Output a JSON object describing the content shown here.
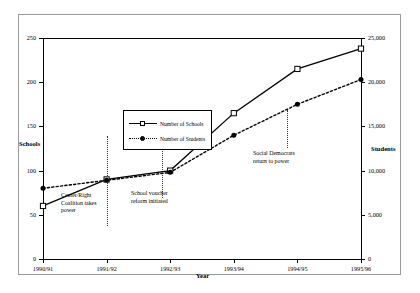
{
  "chart_data": {
    "type": "line",
    "title": "",
    "xlabel": "Year",
    "ylabel": "Schools",
    "y2label": "Students",
    "categories": [
      "1990/91",
      "1991/92",
      "1992/93",
      "1993/94",
      "1994/95",
      "1995/96"
    ],
    "ylim": [
      0,
      250
    ],
    "y2lim": [
      0,
      25000
    ],
    "yticks": [
      "0",
      "50",
      "100",
      "150",
      "200",
      "250"
    ],
    "ytick_values": [
      0,
      50,
      100,
      150,
      200,
      250
    ],
    "y2ticks": [
      "0",
      "5,000",
      "10,000",
      "15,000",
      "20,000",
      "25,000"
    ],
    "y2tick_values": [
      0,
      5000,
      10000,
      15000,
      20000,
      25000
    ],
    "grid": false,
    "legend_position": "upper-left-inside",
    "series": [
      {
        "name": "Number of Schools",
        "axis": "left",
        "marker": "open-square",
        "linestyle": "solid",
        "values": [
          60,
          90,
          100,
          165,
          215,
          238
        ]
      },
      {
        "name": "Number of Students",
        "axis": "right",
        "marker": "filled-circle",
        "linestyle": "dotted",
        "values": [
          8000,
          8900,
          9800,
          14000,
          17500,
          20300
        ]
      }
    ],
    "annotations": [
      {
        "text": "Center/Right\nCoalition takes\npower",
        "event_x_category": "1991/92"
      },
      {
        "text": "School voucher\nreform initiated",
        "event_x_category": "1992/93-early"
      },
      {
        "text": "Social Democrats\nreturn to power",
        "event_x_category": "1994/95-early"
      }
    ]
  },
  "legend": {
    "entries": [
      {
        "label": "Number of Schools"
      },
      {
        "label": "Number of Students"
      }
    ]
  },
  "axes": {
    "left_title": "Schools",
    "right_title": "Students",
    "bottom_title": "Year"
  },
  "colors": {
    "series_line": "#000000",
    "frame": "#9a9a9a",
    "axis": "#000000",
    "event_line": "#333333"
  }
}
